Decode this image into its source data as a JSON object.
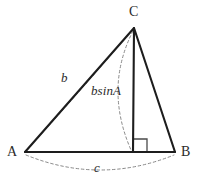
{
  "figure": {
    "kind": "geometry-diagram",
    "colors": {
      "background": "#ffffff",
      "solid_stroke": "#1d1d1d",
      "dashed_stroke": "#8a8a8a",
      "text": "#2b2b2b"
    },
    "vertices": [
      {
        "name": "A",
        "label": "A",
        "x": 25,
        "y": 152
      },
      {
        "name": "B",
        "label": "B",
        "x": 175,
        "y": 152
      },
      {
        "name": "C",
        "label": "C",
        "x": 134,
        "y": 28
      }
    ],
    "foot_of_altitude": {
      "name": "H",
      "x": 133,
      "y": 152
    },
    "solid_edges": [
      {
        "name": "side-AB",
        "from": "A",
        "to": "B"
      },
      {
        "name": "side-AC",
        "from": "A",
        "to": "C"
      },
      {
        "name": "side-CB",
        "from": "C",
        "to": "B"
      },
      {
        "name": "altitude-CH",
        "from": "C",
        "to": "H"
      }
    ],
    "right_angle": {
      "at": "H",
      "size": 13,
      "side": "right"
    },
    "measures": [
      {
        "name": "side-b",
        "label": "b",
        "style": "italic",
        "describes": "length of side AC",
        "label_x": 61,
        "label_y": 71
      },
      {
        "name": "altitude-length",
        "label": "bsinA",
        "style": "italic",
        "describes": "length of altitude from C",
        "label_x": 91,
        "label_y": 84
      },
      {
        "name": "side-c",
        "label": "c",
        "style": "italic",
        "describes": "length of side AB",
        "label_x": 94,
        "label_y": 161
      }
    ]
  }
}
